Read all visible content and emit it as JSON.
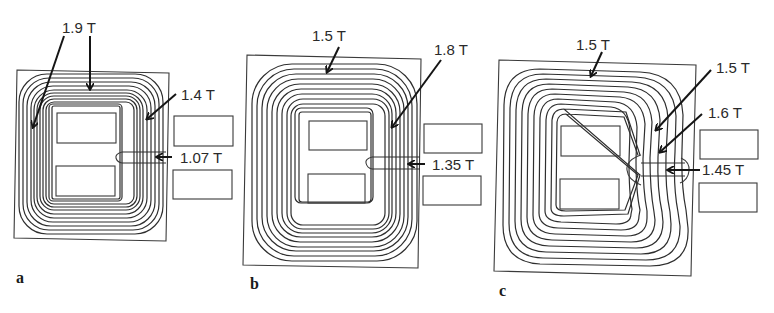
{
  "figure": {
    "panels": [
      {
        "id": "a",
        "label": "a",
        "annotations": [
          {
            "text": "1.9 T",
            "target": "outer left leg and top yoke"
          },
          {
            "text": "1.4 T",
            "target": "center-right leg"
          },
          {
            "text": "1.07 T",
            "target": "air gap"
          }
        ]
      },
      {
        "id": "b",
        "label": "b",
        "annotations": [
          {
            "text": "1.5 T",
            "target": "top yoke"
          },
          {
            "text": "1.8 T",
            "target": "center-right leg"
          },
          {
            "text": "1.35 T",
            "target": "air gap"
          }
        ]
      },
      {
        "id": "c",
        "label": "c",
        "annotations": [
          {
            "text": "1.5 T",
            "target": "top yoke"
          },
          {
            "text": "1.5 T",
            "target": "tapered leg upper"
          },
          {
            "text": "1.6 T",
            "target": "tapered leg near gap"
          },
          {
            "text": "1.45 T",
            "target": "air gap"
          }
        ]
      }
    ]
  },
  "labels": {
    "a_top": "1.9 T",
    "a_right": "1.4 T",
    "a_gap": "1.07 T",
    "a_panel": "a",
    "b_top": "1.5 T",
    "b_right": "1.8 T",
    "b_gap": "1.35 T",
    "b_panel": "b",
    "c_top": "1.5 T",
    "c_right1": "1.5 T",
    "c_right2": "1.6 T",
    "c_gap": "1.45 T",
    "c_panel": "c"
  },
  "colors": {
    "line": "#2e2e2e",
    "background": "#ffffff"
  }
}
